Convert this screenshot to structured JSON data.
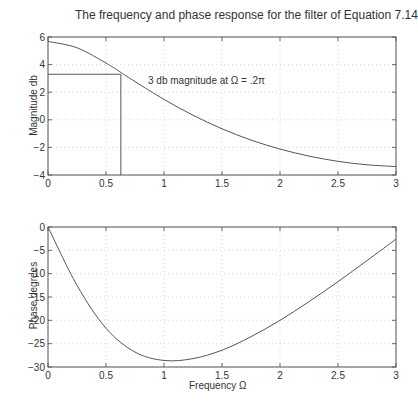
{
  "title": "The frequency and phase response for the filter of Equation 7.14",
  "chart_data": [
    {
      "type": "line",
      "title": "The frequency and phase response for the filter of Equation 7.14",
      "xlabel": "",
      "ylabel": "Magnitude db",
      "xlim": [
        0,
        3
      ],
      "ylim": [
        -4,
        6
      ],
      "xticks": [
        "0",
        "0.5",
        "1",
        "1.5",
        "2",
        "2.5",
        "3"
      ],
      "yticks": [
        "-4",
        "-2",
        "0",
        "2",
        "4",
        "6"
      ],
      "grid": true,
      "x": [
        0,
        0.25,
        0.5,
        0.628,
        0.75,
        1.0,
        1.25,
        1.5,
        1.75,
        2.0,
        2.25,
        2.5,
        2.75,
        3.0
      ],
      "series": [
        {
          "name": "Magnitude",
          "values": [
            5.68,
            5.22,
            4.11,
            3.43,
            2.77,
            1.48,
            0.33,
            -0.65,
            -1.47,
            -2.12,
            -2.63,
            -3.01,
            -3.26,
            -3.39
          ]
        }
      ],
      "annotations": [
        {
          "text": "3 db magnitude at Ω = .2π",
          "x": 0.628,
          "y": 3.3,
          "guide_lines": {
            "horizontal_y": 3.3,
            "vertical_x": 0.628
          }
        }
      ]
    },
    {
      "type": "line",
      "title": "",
      "xlabel": "Frequency Ω",
      "ylabel": "Phase degrees",
      "xlim": [
        0,
        3
      ],
      "ylim": [
        -30,
        0
      ],
      "xticks": [
        "0",
        "0.5",
        "1",
        "1.5",
        "2",
        "2.5",
        "3"
      ],
      "yticks": [
        "-30",
        "-25",
        "-20",
        "-15",
        "-10",
        "-5",
        "0"
      ],
      "grid": true,
      "x": [
        0,
        0.25,
        0.5,
        0.75,
        1.0,
        1.25,
        1.5,
        1.75,
        2.0,
        2.25,
        2.5,
        2.75,
        3.0
      ],
      "series": [
        {
          "name": "Phase",
          "values": [
            0,
            -12.5,
            -21.7,
            -26.8,
            -28.6,
            -28.2,
            -26.4,
            -23.5,
            -20.0,
            -16.0,
            -11.7,
            -7.2,
            -2.6
          ]
        }
      ]
    }
  ]
}
